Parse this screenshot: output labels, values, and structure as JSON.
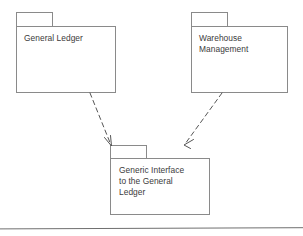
{
  "diagram": {
    "type": "uml-package-diagram",
    "packages": [
      {
        "id": "general-ledger",
        "label": "General Ledger",
        "x": 16,
        "y": 12,
        "width": 100,
        "height": 81
      },
      {
        "id": "warehouse-management",
        "label": "Warehouse\nManagement",
        "x": 191,
        "y": 12,
        "width": 97,
        "height": 81
      },
      {
        "id": "generic-interface",
        "label": "Generic Interface\nto the General\nLedger",
        "x": 110,
        "y": 145,
        "width": 100,
        "height": 70
      }
    ],
    "dependencies": [
      {
        "id": "general-ledger-to-generic-interface",
        "from": "general-ledger",
        "to": "generic-interface",
        "style": "dashed",
        "arrowhead": "open",
        "from_point": [
          90,
          93
        ],
        "to_point": [
          111,
          145
        ]
      },
      {
        "id": "warehouse-management-to-generic-interface",
        "from": "warehouse-management",
        "to": "generic-interface",
        "style": "dashed",
        "arrowhead": "open",
        "from_point": [
          222,
          93
        ],
        "to_point": [
          184,
          144
        ]
      }
    ],
    "footer_rule": {
      "label": "horizontal-rule",
      "y": 228
    },
    "colors": {
      "stroke": "#8a8a8a",
      "text": "#3b3b3b",
      "connector": "#555555",
      "background": "#ffffff",
      "rule": "#6f6f6f"
    }
  }
}
